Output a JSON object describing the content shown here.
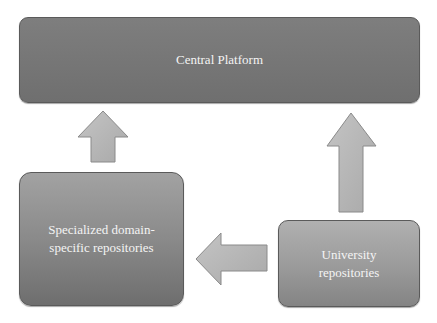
{
  "diagram": {
    "type": "flow",
    "nodes": [
      {
        "id": "central",
        "label": "Central Platform"
      },
      {
        "id": "specialized",
        "label": "Specialized domain-specific repositories"
      },
      {
        "id": "university",
        "label": "University repositories"
      }
    ],
    "edges": [
      {
        "from": "specialized",
        "to": "central",
        "direction": "up"
      },
      {
        "from": "university",
        "to": "central",
        "direction": "up"
      },
      {
        "from": "university",
        "to": "specialized",
        "direction": "left"
      }
    ],
    "colors": {
      "central_fill": "#777777",
      "specialized_fill": "#8c8c8c",
      "university_fill": "#9c9c9c",
      "arrow_fill": "#b8b8b8",
      "text": "#f4f4f4"
    }
  }
}
